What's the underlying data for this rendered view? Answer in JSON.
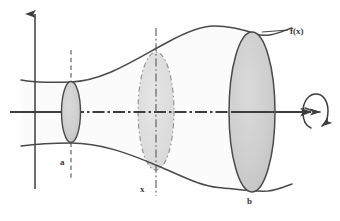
{
  "figure": {
    "kind": "solid-of-revolution-diagram",
    "background_color": "#fefefe",
    "stroke_color": "#4a4a4a",
    "axis_color": "#3d3d3d",
    "fill_color": "#cccccc",
    "dash_color": "#6d6d6d",
    "labels": {
      "function": "f(x)",
      "left_bound": "a",
      "variable": "x",
      "right_bound": "b"
    },
    "axes": {
      "y_axis": {
        "x": 35,
        "y_top": 10,
        "y_bottom": 190,
        "arrow": "up"
      },
      "x_axis": {
        "y": 112,
        "x_left": 10,
        "x_right": 312,
        "arrow": "right",
        "style": "dash-dot"
      }
    },
    "cross_sections": [
      {
        "name": "disk-at-a",
        "cx": 71,
        "cy": 112,
        "rx": 9,
        "ry": 30,
        "style": "solid",
        "filled": true
      },
      {
        "name": "disk-at-x",
        "cx": 156,
        "cy": 111,
        "rx": 18,
        "ry": 59,
        "style": "dashed",
        "filled": true
      },
      {
        "name": "disk-at-b",
        "cx": 252,
        "cy": 112,
        "rx": 23,
        "ry": 80,
        "style": "solid",
        "filled": true
      }
    ],
    "guide_lines": [
      {
        "name": "vertical-at-a",
        "x": 71,
        "y_top": 50,
        "y_bottom": 178,
        "style": "dashed"
      },
      {
        "name": "vertical-at-x",
        "x": 156,
        "y_top": 28,
        "y_bottom": 196,
        "style": "dash-dot"
      }
    ],
    "curves": {
      "upper": "starts left edge y=80, dips to minimum at (71,82), rises to peak near (212,26), meets ellipse top (252,32), exits right at (292,28)",
      "lower": "starts left edge y=146, rises to maximum at (71,143), falls to minimum near (216,187), meets ellipse bottom (252,192), exits right at (292,184)"
    },
    "rotation_arrow": {
      "name": "rotation-loop-arrow",
      "cx": 314,
      "cy": 112,
      "description": "open circular loop around the x-axis with arrowhead indicating revolution"
    }
  }
}
